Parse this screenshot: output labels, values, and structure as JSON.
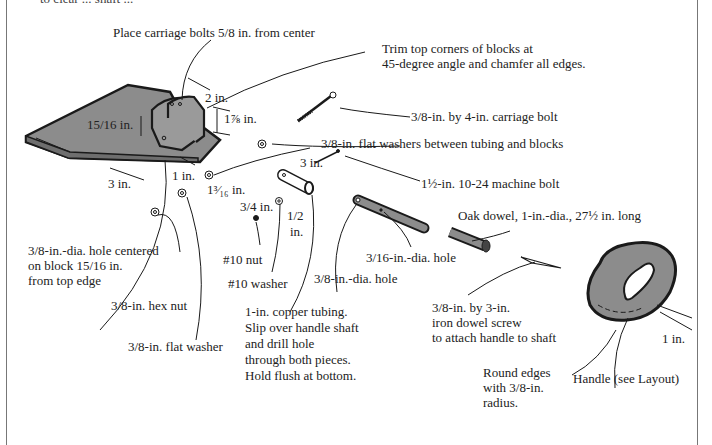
{
  "figure": {
    "title_cut_off": "to clear ... shaft ...",
    "colors": {
      "part_fill": "#8c8c8c",
      "line": "#1a1a1a",
      "background": "#ffffff",
      "frame": "#777777"
    }
  },
  "labels": {
    "carriage_bolt_position": "Place carriage bolts 5/8 in. from center",
    "trim_corners_1": "Trim top corners of blocks at",
    "trim_corners_2": "45-degree angle and chamfer all edges.",
    "dim_2in": "2 in.",
    "dim_1_7_8": "1⅞ in.",
    "dim_15_16": "15/16 in.",
    "dim_3in_block": "3 in.",
    "dim_1in_block": "1 in.",
    "dim_1_3_16": "1³⁄₁₆ in.",
    "carriage_bolt": "3/8-in. by 4-in. carriage bolt",
    "flat_washers_between": "3/8-in. flat washers between tubing and blocks",
    "dim_3in_tube": "3 in.",
    "machine_bolt": "1½-in. 10-24 machine bolt",
    "dim_3_4": "3/4 in.",
    "dim_1_2_a": "1/2",
    "dim_1_2_b": "in.",
    "oak_dowel": "Oak dowel, 1-in.-dia., 27½ in. long",
    "hole_38_1": "3/8-in.-dia. hole centered",
    "hole_38_2": "on block 15/16 in.",
    "hole_38_3": "from top edge",
    "nut_10": "#10 nut",
    "washer_10": "#10 washer",
    "hole_316": "3/16-in.-dia. hole",
    "hole_38_shaft": "3/8-in.-dia. hole",
    "hex_nut": "3/8-in. hex nut",
    "flat_washer": "3/8-in. flat washer",
    "copper_1": "1-in. copper tubing.",
    "copper_2": "Slip over handle shaft",
    "copper_3": "and drill hole",
    "copper_4": "through both pieces.",
    "copper_5": "Hold flush at bottom.",
    "dowel_screw_1": "3/8-in. by 3-in.",
    "dowel_screw_2": "iron dowel screw",
    "dowel_screw_3": "to attach handle to shaft",
    "round_edges_1": "Round edges",
    "round_edges_2": "with 3/8-in.",
    "round_edges_3": "radius.",
    "handle": "Handle (see Layout)",
    "dim_1in_handle": "1 in."
  }
}
